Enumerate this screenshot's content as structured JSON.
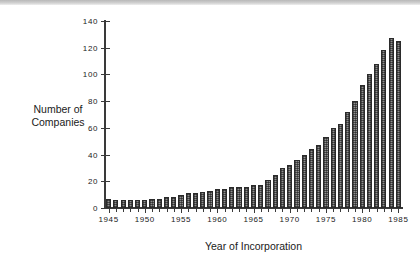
{
  "figure": {
    "y_axis_title_line1": "Number of",
    "y_axis_title_line2": "Companies",
    "x_axis_title": "Year of Incorporation"
  },
  "chart_data": {
    "type": "bar",
    "title": "",
    "subtitle": "",
    "xlabel": "Year of Incorporation",
    "ylabel": "Number of Companies",
    "xlim": [
      1944.5,
      1985.5
    ],
    "ylim": [
      0,
      140
    ],
    "ytick_labels": [
      "0",
      "20",
      "40",
      "60",
      "80",
      "100",
      "120",
      "140"
    ],
    "yticks": [
      0,
      20,
      40,
      60,
      80,
      100,
      120,
      140
    ],
    "xtick_labels": [
      "1945",
      "1950",
      "1955",
      "1960",
      "1965",
      "1970",
      "1975",
      "1980",
      "1985"
    ],
    "xticks": [
      1945,
      1950,
      1955,
      1960,
      1965,
      1970,
      1975,
      1980,
      1985
    ],
    "grid": false,
    "legend": "none",
    "bar_fill": "#8f8f8f",
    "bar_edge": "#2b2b2b",
    "categories": [
      1945,
      1946,
      1947,
      1948,
      1949,
      1950,
      1951,
      1952,
      1953,
      1954,
      1955,
      1956,
      1957,
      1958,
      1959,
      1960,
      1961,
      1962,
      1963,
      1964,
      1965,
      1966,
      1967,
      1968,
      1969,
      1970,
      1971,
      1972,
      1973,
      1974,
      1975,
      1976,
      1977,
      1978,
      1979,
      1980,
      1981,
      1982,
      1983,
      1984,
      1985
    ],
    "values": [
      7,
      6,
      6,
      6,
      6,
      6,
      7,
      7,
      8,
      8,
      10,
      11,
      11,
      12,
      13,
      14,
      14,
      16,
      16,
      16,
      17,
      17,
      21,
      25,
      30,
      32,
      36,
      40,
      44,
      47,
      53,
      60,
      63,
      72,
      80,
      92,
      100,
      108,
      118,
      127,
      125
    ]
  }
}
